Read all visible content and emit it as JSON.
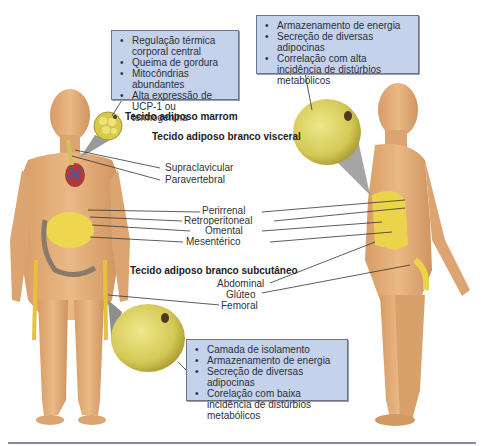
{
  "brown_fat": {
    "title": "Tecido adiposo marrom",
    "bullets": [
      "Regulação térmica corporal central",
      "Queima de gordura",
      "Mitocôndrias abundantes",
      "Alta expressão de UCP-1 ou termogenina"
    ],
    "locations": [
      "Supraclavicular",
      "Paravertebral"
    ]
  },
  "visceral_fat": {
    "title": "Tecido adiposo branco visceral",
    "bullets": [
      "Armazenamento de energia",
      "Secreção de diversas adipocinas",
      "Correlação com alta incidência de distúrbios metabólicos"
    ],
    "locations": [
      "Perirrenal",
      "Retroperitoneal",
      "Omental",
      "Mesentérico"
    ]
  },
  "subcutaneous_fat": {
    "title": "Tecido adiposo branco subcutâneo",
    "bullets": [
      "Camada de isolamento",
      "Armazenamento de energia",
      "Secreção de diversas adipocinas",
      "Corelação com baixa incidência de distúrbios  metabólicos"
    ],
    "locations": [
      "Abdominal",
      "Glúteo",
      "Femoral"
    ]
  },
  "colors": {
    "skin": "#e3b07c",
    "skin_shade": "#c98f5c",
    "fat_yellow": "#e9d44a",
    "adipocyte": "#d9cf5e",
    "box_fill": "#c5d2ec",
    "rule": "#8488a4"
  }
}
